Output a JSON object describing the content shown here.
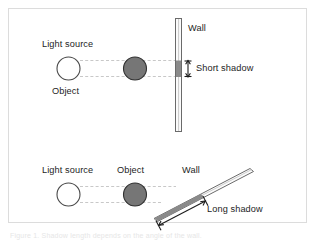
{
  "figure": {
    "frame": {
      "border_color": "#dcdcdc",
      "background": "#ffffff"
    },
    "caption": "Figure 1. Shadow length depends on the angle of the wall."
  },
  "palette": {
    "ink": "#1d1d1d",
    "object_fill": "#767676",
    "object_stroke": "#333333",
    "light_fill": "#ffffff",
    "light_stroke": "#444444",
    "wall_fill": "#fbfbfb",
    "wall_stroke": "#5a5a5a",
    "shadow_fill": "#8a8a8a",
    "ray_dash": "#c8c8c8",
    "frame": "#dcdcdc"
  },
  "panels": [
    {
      "id": "perpendicular-wall",
      "name": "short-shadow-panel",
      "labels": {
        "light_source": "Light source",
        "object": "Object",
        "wall": "Wall",
        "shadow": "Short shadow"
      },
      "wall_angle_deg": 0,
      "shadow_length_px": 24
    },
    {
      "id": "tilted-wall",
      "name": "long-shadow-panel",
      "labels": {
        "light_source": "Light source",
        "object": "Object",
        "wall": "Wall",
        "shadow": "Long shadow"
      },
      "wall_angle_deg": 27,
      "shadow_length_px": 60
    }
  ]
}
